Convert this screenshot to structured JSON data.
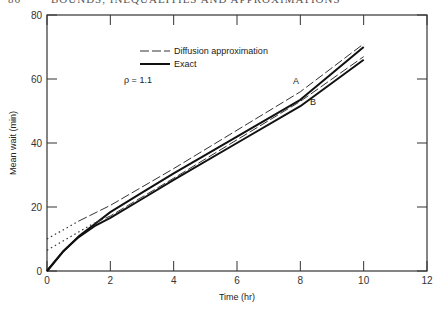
{
  "header": {
    "page_number": "86",
    "running_title": "BOUNDS, INEQUALITIES AND APPROXIMATIONS"
  },
  "chart_data": {
    "type": "line",
    "title": "",
    "xlabel": "Time (hr)",
    "ylabel": "Mean wait (min)",
    "xlim": [
      0,
      12
    ],
    "ylim": [
      0,
      80
    ],
    "xticks": [
      "0",
      "2",
      "4",
      "6",
      "8",
      "10",
      "12"
    ],
    "yticks": [
      "0",
      "20",
      "40",
      "60",
      "80"
    ],
    "grid": false,
    "legend": {
      "position": "upper left",
      "entries": [
        "Diffusion approximation",
        "Exact"
      ]
    },
    "annotation": "ρ = 1.1",
    "curve_labels": [
      "A",
      "B"
    ],
    "series": [
      {
        "name": "Exact A",
        "style": "solid",
        "x": [
          0,
          0.5,
          1,
          1.5,
          2,
          3,
          4,
          6,
          8,
          10
        ],
        "y": [
          0,
          6,
          10.8,
          14.6,
          18.4,
          24.5,
          30.5,
          42,
          53.5,
          70
        ]
      },
      {
        "name": "Exact B",
        "style": "solid",
        "x": [
          0,
          0.5,
          1,
          1.5,
          2,
          3,
          4,
          6,
          8,
          10
        ],
        "y": [
          0,
          6,
          10.6,
          14,
          16.6,
          22.5,
          28.5,
          40,
          51.5,
          66
        ]
      },
      {
        "name": "Diffusion A",
        "style": "dashed",
        "x": [
          1,
          2,
          4,
          6,
          8,
          10
        ],
        "y": [
          15.6,
          20.5,
          32,
          44,
          56,
          71
        ]
      },
      {
        "name": "Diffusion B",
        "style": "dashed",
        "x": [
          1.5,
          2,
          4,
          6,
          8,
          10
        ],
        "y": [
          15,
          17.2,
          29,
          41,
          53,
          67
        ]
      },
      {
        "name": "Diffusion A extrapolation",
        "style": "dotted",
        "x": [
          0,
          1
        ],
        "y": [
          10,
          15.6
        ]
      },
      {
        "name": "Diffusion B extrapolation",
        "style": "dotted",
        "x": [
          0,
          1.5
        ],
        "y": [
          6.5,
          15
        ]
      }
    ]
  }
}
